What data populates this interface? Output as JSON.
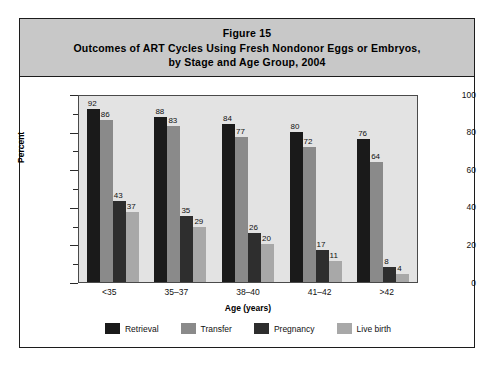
{
  "figure": {
    "title_lines": [
      "Figure 15",
      "Outcomes of ART Cycles Using Fresh Nondonor Eggs or Embryos,",
      "by Stage and Age Group, 2004"
    ]
  },
  "colors": {
    "title_band": "#c8c8c8",
    "plot_background": "#e3e3e3",
    "frame": "#1c1c1c",
    "retrieval": "#1a1a1a",
    "transfer": "#8a8a8a",
    "pregnancy": "#2e2e2e",
    "live_birth": "#a8a8a8"
  },
  "chart_data": {
    "type": "bar",
    "title": "Outcomes of ART Cycles Using Fresh Nondonor Eggs or Embryos, by Stage and Age Group, 2004",
    "subtitle": "Figure 15",
    "xlabel": "Age (years)",
    "ylabel": "Percent",
    "ylim": [
      0,
      100
    ],
    "ytick_labels": [
      "0",
      "20",
      "40",
      "60",
      "80",
      "100"
    ],
    "ytick_values": [
      0,
      20,
      40,
      60,
      80,
      100
    ],
    "yminor_values": [
      10,
      30,
      50,
      70,
      90
    ],
    "grid": false,
    "legend_position": "bottom",
    "categories": [
      "<35",
      "35–37",
      "38–40",
      "41–42",
      ">42"
    ],
    "series": [
      {
        "name": "Retrieval",
        "color": "#1a1a1a",
        "values": [
          92,
          88,
          84,
          80,
          76
        ]
      },
      {
        "name": "Transfer",
        "color": "#8a8a8a",
        "values": [
          86,
          83,
          77,
          72,
          64
        ]
      },
      {
        "name": "Pregnancy",
        "color": "#2e2e2e",
        "values": [
          43,
          35,
          26,
          17,
          8
        ]
      },
      {
        "name": "Live birth",
        "color": "#a8a8a8",
        "values": [
          37,
          29,
          20,
          11,
          4
        ]
      }
    ]
  }
}
